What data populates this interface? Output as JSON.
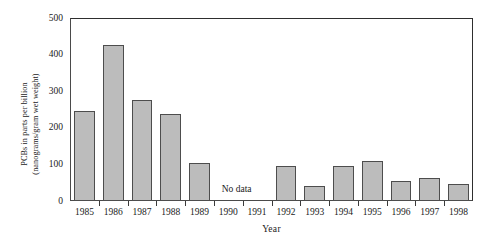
{
  "chart_data": {
    "type": "bar",
    "title": "",
    "subtitle": "",
    "xlabel": "Year",
    "ylabel_line1": "PCBs in parts per billion",
    "ylabel_line2": "(nanograms/gram wet weight)",
    "categories": [
      "1985",
      "1986",
      "1987",
      "1988",
      "1989",
      "1990",
      "1991",
      "1992",
      "1993",
      "1994",
      "1995",
      "1996",
      "1997",
      "1998"
    ],
    "values": [
      245,
      425,
      275,
      238,
      105,
      null,
      null,
      95,
      40,
      95,
      110,
      55,
      62,
      47
    ],
    "series": [
      {
        "name": "PCBs in parts per billion",
        "values": [
          245,
          425,
          275,
          238,
          105,
          null,
          null,
          95,
          40,
          95,
          110,
          55,
          62,
          47
        ]
      }
    ],
    "ylim": [
      0,
      500
    ],
    "yticks": [
      0,
      100,
      200,
      300,
      400,
      500
    ],
    "ytick_labels": [
      "0",
      "100",
      "200",
      "300",
      "400",
      "500"
    ],
    "grid": false,
    "legend": null,
    "legend_position": "none",
    "annotations": [
      {
        "text": "No data",
        "x_categories": [
          "1990",
          "1991"
        ],
        "value": null
      }
    ],
    "missing_categories": [
      "1990",
      "1991"
    ],
    "colors": {
      "bar_fill": "#bcbcbc",
      "bar_border": "#4d4d4d",
      "axis": "#3a3a3a",
      "text": "#1a1a1a",
      "background": "#ffffff"
    }
  }
}
